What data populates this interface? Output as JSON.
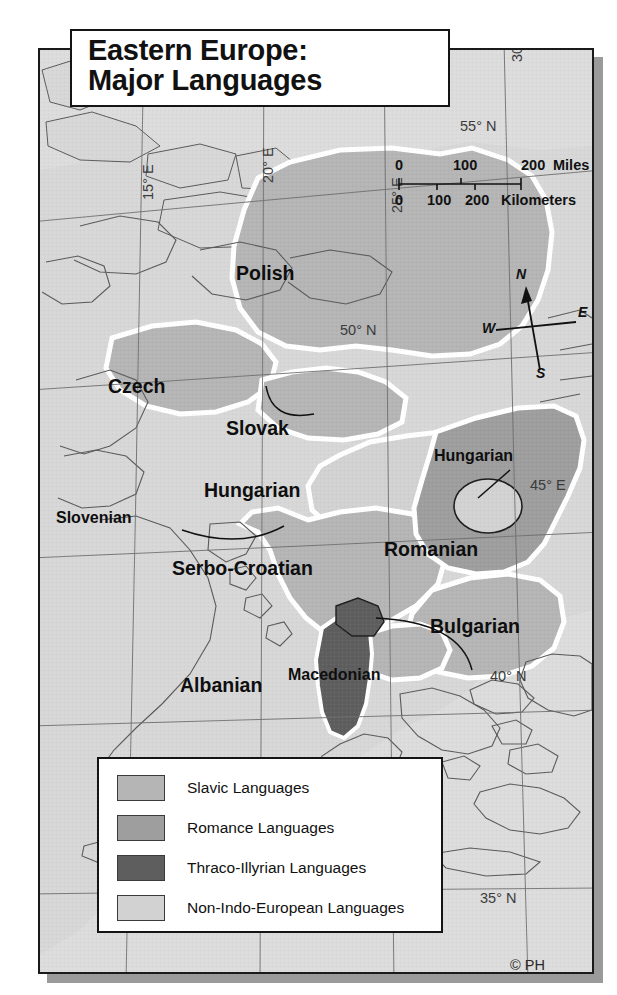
{
  "title": {
    "line1": "Eastern Europe:",
    "line2": "Major Languages"
  },
  "colors": {
    "slavic": "#b5b5b5",
    "romance": "#9e9e9e",
    "thraco_illyrian": "#5e5e5e",
    "non_indo_european": "#d2d2d2",
    "water": "#dcdcdc",
    "land_other": "#d7d7d7",
    "border_white": "#ffffff",
    "outline": "#4a4a4a",
    "frame": "#1a1a1a",
    "shadow": "#9a9a9a"
  },
  "legend": {
    "items": [
      {
        "label": "Slavic Languages",
        "color": "#b5b5b5"
      },
      {
        "label": "Romance Languages",
        "color": "#9e9e9e"
      },
      {
        "label": "Thraco-Illyrian Languages",
        "color": "#5e5e5e"
      },
      {
        "label": "Non-Indo-European Languages",
        "color": "#d2d2d2"
      }
    ]
  },
  "scalebar": {
    "miles": {
      "ticks": [
        "0",
        "100",
        "200"
      ],
      "unit": "Miles"
    },
    "kilometers": {
      "ticks": [
        "0",
        "100",
        "200"
      ],
      "unit": "Kilometers"
    }
  },
  "compass": {
    "north": "N",
    "east": "E",
    "south": "S",
    "west": "W"
  },
  "map_labels": [
    {
      "name": "polish",
      "text": "Polish",
      "size": "big"
    },
    {
      "name": "czech",
      "text": "Czech",
      "size": "big"
    },
    {
      "name": "slovak",
      "text": "Slovak",
      "size": "big"
    },
    {
      "name": "hungarian",
      "text": "Hungarian",
      "size": "big"
    },
    {
      "name": "slovenian",
      "text": "Slovenian",
      "size": "med"
    },
    {
      "name": "serbo-croatian",
      "text": "Serbo-Croatian",
      "size": "big"
    },
    {
      "name": "romanian",
      "text": "Romanian",
      "size": "big"
    },
    {
      "name": "hungarian-enclave",
      "text": "Hungarian",
      "size": "med"
    },
    {
      "name": "bulgarian",
      "text": "Bulgarian",
      "size": "big"
    },
    {
      "name": "macedonian",
      "text": "Macedonian",
      "size": "med"
    },
    {
      "name": "albanian",
      "text": "Albanian",
      "size": "big"
    }
  ],
  "graticule": {
    "latitudes": [
      "55° N",
      "50° N",
      "45° E",
      "40° N",
      "35° N"
    ],
    "longitudes": [
      "15° E",
      "20° E",
      "25° E",
      "30° E"
    ]
  },
  "credit": "© PH"
}
